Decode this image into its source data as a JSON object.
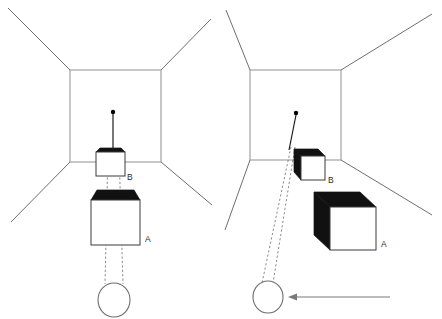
{
  "figure": {
    "panels": [
      {
        "id": "left-panel",
        "name": "frontal-view-panel",
        "position_label": "left",
        "room": {
          "back_wall": {
            "x": 70,
            "y": 70,
            "width": 91,
            "height": 92
          },
          "corner_rays": [
            {
              "from": [
                70,
                70
              ],
              "to": [
                8,
                8
              ]
            },
            {
              "from": [
                161,
                70
              ],
              "to": [
                211,
                19
              ]
            },
            {
              "from": [
                70,
                162
              ],
              "to": [
                11,
                222
              ]
            },
            {
              "from": [
                161,
                162
              ],
              "to": [
                212,
                205
              ]
            }
          ]
        },
        "cubes": [
          {
            "label": "B",
            "name": "cube-b",
            "front": {
              "x": 96,
              "y": 152,
              "width": 29,
              "height": 24
            },
            "top_fill": "#111111",
            "label_pos": [
              130,
              179
            ],
            "style": "frontal-flat"
          },
          {
            "label": "A",
            "name": "cube-a",
            "front": {
              "x": 91,
              "y": 200,
              "width": 49,
              "height": 45
            },
            "top_fill": "#111111",
            "label_pos": [
              147,
              241
            ],
            "style": "frontal-flat"
          }
        ],
        "eye": {
          "cx": 114,
          "cy": 300,
          "rx": 16,
          "ry": 17
        },
        "target_dot": {
          "cx": 113,
          "cy": 112,
          "r": 2.1
        },
        "solid_ray": {
          "from": [
            113,
            114
          ],
          "to": [
            113,
            150
          ]
        },
        "sight_lines": [
          {
            "from": [
              108,
              151
            ],
            "to": [
              106,
              283
            ]
          },
          {
            "from": [
              118,
              151
            ],
            "to": [
              122,
              283
            ]
          }
        ],
        "motion_arrow": null
      },
      {
        "id": "right-panel",
        "name": "oblique-view-panel",
        "position_label": "right",
        "room": {
          "back_wall": {
            "x": 250,
            "y": 70,
            "width": 91,
            "height": 90
          },
          "corner_rays": [
            {
              "from": [
                250,
                70
              ],
              "to": [
                226,
                10
              ]
            },
            {
              "from": [
                341,
                70
              ],
              "to": [
                432,
                14
              ]
            },
            {
              "from": [
                250,
                160
              ],
              "to": [
                225,
                230
              ]
            },
            {
              "from": [
                341,
                160
              ],
              "to": [
                432,
                215
              ]
            }
          ]
        },
        "cubes": [
          {
            "label": "B",
            "name": "cube-b",
            "front": {
              "x": 301,
              "y": 156,
              "width": 24,
              "height": 24
            },
            "depth": 8,
            "top_fill": "#111111",
            "side_fill": "#111111",
            "label_pos": [
              330,
              182
            ],
            "style": "oblique-3d"
          },
          {
            "label": "A",
            "name": "cube-a",
            "front": {
              "x": 330,
              "y": 207,
              "width": 46,
              "height": 43
            },
            "depth": 17,
            "top_fill": "#000000",
            "side_fill": "#000000",
            "label_pos": [
              383,
              246
            ],
            "style": "oblique-3d"
          }
        ],
        "eye": {
          "cx": 268,
          "cy": 297,
          "rx": 15,
          "ry": 16
        },
        "target_dot": {
          "cx": 296,
          "cy": 113,
          "r": 2.1
        },
        "solid_ray": {
          "from": [
            296,
            115
          ],
          "to": [
            288,
            152
          ]
        },
        "sight_lines": [
          {
            "from": [
              290,
              150
            ],
            "to": [
              264,
              281
            ]
          },
          {
            "from": [
              294,
              150
            ],
            "to": [
              272,
              281
            ]
          }
        ],
        "motion_arrow": {
          "from": [
            390,
            297
          ],
          "to": [
            288,
            297
          ]
        }
      }
    ],
    "labels": {
      "cube_a": "A",
      "cube_b": "B"
    },
    "colors": {
      "background": "#ffffff",
      "room_outline": "#6e6e6e",
      "cube_outline": "#3a3a3a",
      "cube_shadow_fill": "#111111",
      "sight_line": "#7d7d7d",
      "arrow": "#7a7a7a",
      "label_text": "#2b2b2b"
    }
  }
}
